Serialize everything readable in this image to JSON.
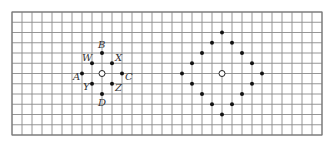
{
  "grid": {
    "cols": 31,
    "rows": 12,
    "origin_x": 12,
    "origin_y": 12,
    "cell_w": 10,
    "cell_h": 10.25,
    "line_color": "#8a8a8a",
    "border_color": "#777777"
  },
  "left_figure": {
    "center": {
      "col": 9,
      "row": 6,
      "type": "open-circle"
    },
    "points": [
      {
        "label": "B",
        "dc": 0,
        "dr": -2,
        "lx": -4,
        "ly": -5
      },
      {
        "label": "W",
        "dc": -1,
        "dr": -1,
        "lx": -10,
        "ly": -2
      },
      {
        "label": "X",
        "dc": 1,
        "dr": -1,
        "lx": 3,
        "ly": -2
      },
      {
        "label": "A",
        "dc": -2,
        "dr": 0,
        "lx": -9,
        "ly": 6
      },
      {
        "label": "C",
        "dc": 2,
        "dr": 0,
        "lx": 3,
        "ly": 6
      },
      {
        "label": "Y",
        "dc": -1,
        "dr": 1,
        "lx": -9,
        "ly": 6
      },
      {
        "label": "Z",
        "dc": 1,
        "dr": 1,
        "lx": 3,
        "ly": 7
      },
      {
        "label": "D",
        "dc": 0,
        "dr": 2,
        "lx": -4,
        "ly": 12
      }
    ]
  },
  "right_figure": {
    "center": {
      "col": 21,
      "row": 6,
      "type": "open-circle"
    },
    "points": [
      {
        "dc": 0,
        "dr": -4
      },
      {
        "dc": -1,
        "dr": -3
      },
      {
        "dc": 1,
        "dr": -3
      },
      {
        "dc": -2,
        "dr": -2
      },
      {
        "dc": 2,
        "dr": -2
      },
      {
        "dc": -3,
        "dr": -1
      },
      {
        "dc": 3,
        "dr": -1
      },
      {
        "dc": -4,
        "dr": 0
      },
      {
        "dc": 4,
        "dr": 0
      },
      {
        "dc": -3,
        "dr": 1
      },
      {
        "dc": 3,
        "dr": 1
      },
      {
        "dc": -2,
        "dr": 2
      },
      {
        "dc": 2,
        "dr": 2
      },
      {
        "dc": -1,
        "dr": 3
      },
      {
        "dc": 1,
        "dr": 3
      },
      {
        "dc": 0,
        "dr": 4
      }
    ]
  }
}
